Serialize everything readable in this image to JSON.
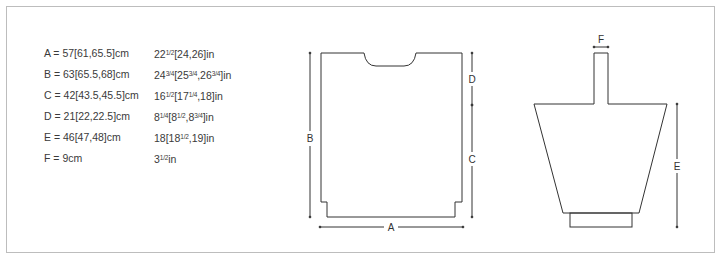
{
  "measurements": [
    {
      "key": "A",
      "cm": "A = 57[61,65.5]cm",
      "in_parts": [
        "22",
        "1/2",
        "[24,26]in"
      ]
    },
    {
      "key": "B",
      "cm": "B = 63[65.5,68]cm",
      "in_parts": [
        "24",
        "3/4",
        "[25",
        "3/4",
        ",26",
        "3/4",
        "]in"
      ]
    },
    {
      "key": "C",
      "cm": "C = 42[43.5,45.5]cm",
      "in_parts": [
        "16",
        "1/2",
        "[17",
        "1/4",
        ",18]in"
      ]
    },
    {
      "key": "D",
      "cm": "D = 21[22,22.5]cm",
      "in_parts": [
        "8",
        "1/4",
        "[8",
        "1/2",
        ",8",
        "3/4",
        "]in"
      ]
    },
    {
      "key": "E",
      "cm": "E = 46[47,48]cm",
      "in_parts": [
        "18[18",
        "1/2",
        ",19]in"
      ]
    },
    {
      "key": "F",
      "cm": "F = 9cm",
      "in_parts": [
        "3",
        "1/2",
        "in"
      ]
    }
  ],
  "body_diagram": {
    "labels": {
      "width": "A",
      "length": "B",
      "side": "C",
      "armhole": "D"
    }
  },
  "sleeve_diagram": {
    "labels": {
      "strap": "F",
      "length": "E"
    }
  },
  "colors": {
    "line": "#333333",
    "frame": "#bdbdbd",
    "text": "#3a3a3a"
  }
}
